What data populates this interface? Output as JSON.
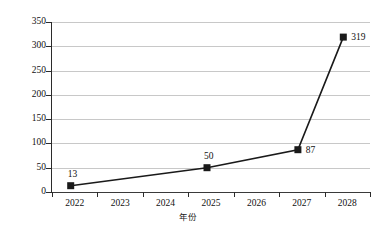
{
  "chart_data": {
    "type": "line",
    "title": "",
    "xlabel": "年份",
    "ylabel": "产业规模/亿美元",
    "categories": [
      "2022",
      "2023",
      "2024",
      "2025",
      "2026",
      "2027",
      "2028"
    ],
    "x": [
      2022,
      2023,
      2024,
      2025,
      2026,
      2027,
      2028
    ],
    "series": [
      {
        "name": "产业规模",
        "values": [
          13,
          null,
          null,
          50,
          null,
          87,
          319
        ],
        "marker": "square",
        "color": "#1a1a1a"
      }
    ],
    "labeled_points": [
      {
        "category": "2022",
        "value": 13,
        "label": "13",
        "label_position": "above-left"
      },
      {
        "category": "2025",
        "value": 50,
        "label": "50",
        "label_position": "above-left"
      },
      {
        "category": "2027",
        "value": 87,
        "label": "87",
        "label_position": "right"
      },
      {
        "category": "2028",
        "value": 319,
        "label": "319",
        "label_position": "right"
      }
    ],
    "ylim": [
      0,
      350
    ],
    "y_ticks": [
      0,
      50,
      100,
      150,
      200,
      250,
      300,
      350
    ],
    "y_tick_labels": [
      "0",
      "50",
      "100",
      "150",
      "200",
      "250",
      "300",
      "350"
    ],
    "grid": {
      "horizontal": true,
      "vertical": false,
      "color": "#c8c8c8"
    },
    "legend": {
      "visible": false,
      "position": "none"
    },
    "axis_style": {
      "left_axis_color": "#2b2b2b",
      "baseline_color": "#3a3a3a",
      "tick_direction": "outward",
      "right_border": false,
      "top_border": false
    }
  }
}
